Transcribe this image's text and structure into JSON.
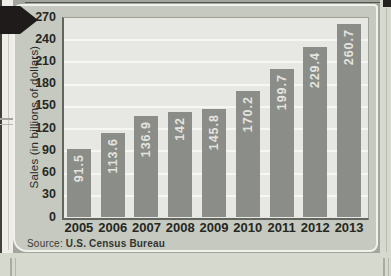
{
  "panel": {
    "source_prefix": "Source:",
    "source_name": "U.S. Census Bureau"
  },
  "chart_data": {
    "type": "bar",
    "title": "",
    "xlabel": "",
    "ylabel": "Sales (in billions of dollars)",
    "categories": [
      "2005",
      "2006",
      "2007",
      "2008",
      "2009",
      "2010",
      "2011",
      "2012",
      "2013"
    ],
    "values": [
      91.5,
      113.6,
      136.9,
      142,
      145.8,
      170.2,
      199.7,
      229.4,
      260.7
    ],
    "bar_labels": [
      "91.5",
      "113.6",
      "136.9",
      "142",
      "145.8",
      "170.2",
      "199.7",
      "229.4",
      "260.7"
    ],
    "yticks": [
      0,
      30,
      60,
      90,
      120,
      150,
      180,
      210,
      240,
      270
    ],
    "ylim": [
      0,
      270
    ],
    "grid": true,
    "legend": "none",
    "colors": {
      "bar": "#8b8d89",
      "bar_label": "#e4e4df",
      "plot_bg": "#e7e8e3",
      "gridline": "#f6f6f3",
      "axis_text": "#262823",
      "panel_bg": "#c5c9bf",
      "arrow": "#1f1b1a"
    }
  }
}
